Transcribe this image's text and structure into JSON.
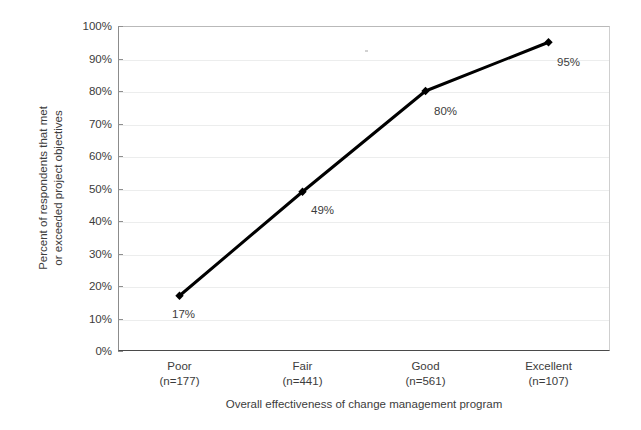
{
  "chart_data": {
    "type": "line",
    "title": "",
    "xlabel": "Overall effectiveness of change management program",
    "ylabel": "Percent of respondents that met or exceeded project objectives",
    "ylabel_lines": [
      "Percent of respondents that met",
      "or exceeded project objectives"
    ],
    "categories": [
      "Poor",
      "Fair",
      "Good",
      "Excellent"
    ],
    "category_counts": [
      "(n=177)",
      "(n=441)",
      "(n=561)",
      "(n=107)"
    ],
    "values": [
      17,
      49,
      80,
      95
    ],
    "point_labels": [
      "17%",
      "49%",
      "80%",
      "95%"
    ],
    "ylim": [
      0,
      100
    ],
    "ytick_values": [
      0,
      10,
      20,
      30,
      40,
      50,
      60,
      70,
      80,
      90,
      100
    ],
    "ytick_labels": [
      "0%",
      "10%",
      "20%",
      "30%",
      "40%",
      "50%",
      "60%",
      "70%",
      "80%",
      "90%",
      "100%"
    ],
    "grid": true,
    "legend": "none",
    "series": [
      {
        "name": "Percent meeting or exceeding objectives",
        "values": [
          17,
          49,
          80,
          95
        ],
        "color": "#000000",
        "marker": "diamond"
      }
    ],
    "colors": {
      "line": "#111111",
      "marker": "#000000",
      "gridline": "#eceded",
      "axis": "#4a4a4a",
      "text": "#3c3c3c",
      "background": "#ffffff"
    }
  }
}
